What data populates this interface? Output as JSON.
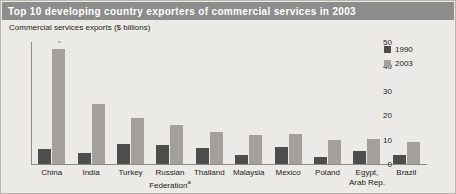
{
  "header": {
    "title": "Top 10 developing country exporters of commercial services in 2003"
  },
  "subtitle": "Commercial services exports ($ billions)",
  "legend": {
    "position": "top-right",
    "entries": [
      {
        "label": "1990",
        "color": "#4d4d4d"
      },
      {
        "label": "2003",
        "color": "#a3a09b"
      }
    ]
  },
  "axis": {
    "y_ticks": [
      "50",
      "40",
      "30",
      "20",
      "10",
      "0"
    ]
  },
  "chart_data": {
    "type": "bar",
    "title": "Top 10 developing country exporters of commercial services in 2003",
    "subtitle": "Commercial services exports ($ billions)",
    "xlabel": "",
    "ylabel": "Commercial services exports ($ billions)",
    "ylim": [
      0,
      50
    ],
    "yticks": [
      0,
      10,
      20,
      30,
      40,
      50
    ],
    "grid": false,
    "legend_position": "top-right",
    "categories": [
      "China",
      "India",
      "Turkey",
      "Russian Federationᵃ",
      "Thailand",
      "Malaysia",
      "Mexico",
      "Poland",
      "Egypt, Arab Rep.",
      "Brazil"
    ],
    "category_lines": [
      [
        "China"
      ],
      [
        "India"
      ],
      [
        "Turkey"
      ],
      [
        "Russian",
        "Federation"
      ],
      [
        "Thailand"
      ],
      [
        "Malaysia"
      ],
      [
        "Mexico"
      ],
      [
        "Poland"
      ],
      [
        "Egypt,",
        "Arab Rep."
      ],
      [
        "Brazil"
      ]
    ],
    "footnote_marker": "a",
    "footnote_category_index": 3,
    "series": [
      {
        "name": "1990",
        "color": "#4d4d4d",
        "values": [
          6.0,
          4.5,
          8.0,
          7.8,
          6.5,
          3.7,
          7.0,
          3.0,
          5.5,
          3.5
        ]
      },
      {
        "name": "2003",
        "color": "#a3a09b",
        "values": [
          47.0,
          24.7,
          19.0,
          16.0,
          13.2,
          12.0,
          12.5,
          9.8,
          10.3,
          9.0
        ]
      }
    ]
  },
  "colors": {
    "header_bar": "#8c8c8c",
    "header_text": "#ffffff",
    "figure_background": "#eceae6",
    "axis": "#8e8b86",
    "series_1990": "#4d4d4d",
    "series_2003": "#a3a09b"
  }
}
